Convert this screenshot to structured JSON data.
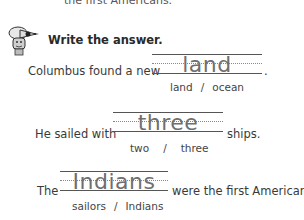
{
  "top_fragment": "the first Americans.",
  "instruction": "Write the answer.",
  "mascot_icon": "pencil-mascot-icon",
  "questions": [
    {
      "before": "Columbus found a new",
      "answer": "land",
      "after": ".",
      "choices": [
        "land",
        "ocean"
      ],
      "separator": "/"
    },
    {
      "before": "He sailed with",
      "answer": "three",
      "after": "ships.",
      "choices": [
        "two",
        "three"
      ],
      "separator": "/"
    },
    {
      "before": "The",
      "answer": "Indians",
      "after": "were the first Americans.",
      "choices": [
        "sailors",
        "Indians"
      ],
      "separator": "/"
    }
  ]
}
